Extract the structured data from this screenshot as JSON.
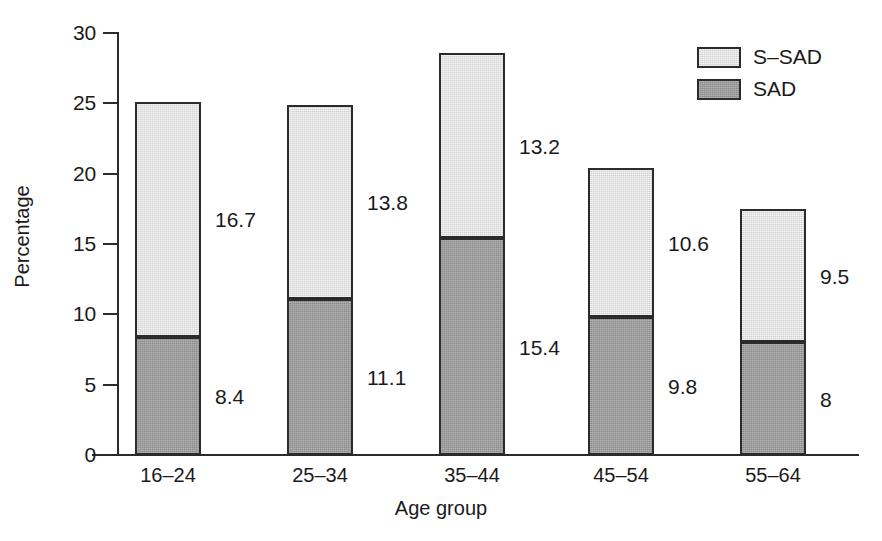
{
  "chart_data": {
    "type": "bar",
    "subtype": "stacked-bar",
    "title": "",
    "xlabel": "Age group",
    "ylabel": "Percentage",
    "categories": [
      "16–24",
      "25–34",
      "35–44",
      "45–54",
      "55–64"
    ],
    "series": [
      {
        "name": "SAD",
        "color": "#8b8b8b",
        "values": [
          8.4,
          11.1,
          15.4,
          9.8,
          8
        ],
        "labels": [
          "8.4",
          "11.1",
          "15.4",
          "9.8",
          "8"
        ]
      },
      {
        "name": "S–SAD",
        "color": "#d2d2d2",
        "values": [
          16.7,
          13.8,
          13.2,
          10.6,
          9.5
        ],
        "labels": [
          "16.7",
          "13.8",
          "13.2",
          "10.6",
          "9.5"
        ]
      }
    ],
    "totals": [
      25.1,
      24.9,
      28.6,
      20.4,
      17.5
    ],
    "ylim": [
      0,
      30
    ],
    "yticks": [
      0,
      5,
      10,
      15,
      20,
      25,
      30
    ],
    "ytick_labels": [
      "0",
      "5",
      "10",
      "15",
      "20",
      "25",
      "30"
    ],
    "grid": false,
    "legend_position": "top-right",
    "legend": [
      {
        "label": "S–SAD",
        "color": "#d2d2d2"
      },
      {
        "label": "SAD",
        "color": "#8b8b8b"
      }
    ]
  },
  "axes": {
    "y_title": "Percentage",
    "x_title": "Age group"
  },
  "colors": {
    "upper_segment": "#d2d2d2",
    "lower_segment": "#8b8b8b",
    "outline": "#2b2b2b",
    "text": "#1a1a1a",
    "background": "#ffffff"
  }
}
